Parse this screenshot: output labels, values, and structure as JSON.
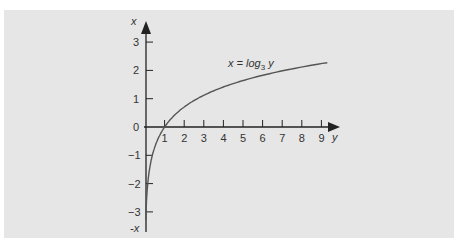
{
  "chart_data": {
    "type": "line",
    "title": "",
    "xlabel": "y",
    "ylabel": "x",
    "y_axis_bottom_label": "-x",
    "series": [
      {
        "name": "x = log3 y",
        "label_main": "x = log",
        "label_sub": "3",
        "label_var": " y",
        "function": "log3",
        "x": [
          0.04,
          0.06,
          0.1,
          0.2,
          0.33,
          0.5,
          1,
          2,
          3,
          4,
          5,
          6,
          7,
          8,
          9,
          9.3
        ],
        "values": [
          -2.93,
          -2.56,
          -2.1,
          -1.46,
          -1.0,
          -0.63,
          0,
          0.63,
          1.0,
          1.26,
          1.46,
          1.63,
          1.77,
          1.89,
          2.0,
          2.03
        ]
      }
    ],
    "x_ticks": [
      "1",
      "2",
      "3",
      "4",
      "5",
      "6",
      "7",
      "8",
      "9"
    ],
    "y_ticks": [
      "3",
      "2",
      "1",
      "0",
      "−1",
      "−2",
      "−3"
    ],
    "xlim": [
      0,
      9.8
    ],
    "ylim": [
      -3.7,
      3.6
    ],
    "grid": false,
    "legend": "inline label near curve",
    "colors": {
      "curve": "#555555",
      "axis": "#222222",
      "background": "#e6e6e6"
    }
  }
}
